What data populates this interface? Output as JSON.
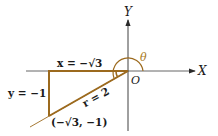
{
  "diagram": {
    "type": "trigonometry-reference-triangle",
    "axes": {
      "x_label": "X",
      "y_label": "Y",
      "origin_label": "O"
    },
    "angle_label": "θ",
    "labels": {
      "x_side": "x = −√3",
      "y_side": "y = −1",
      "hypotenuse": "r = 2",
      "point": "(−√3, −1)"
    },
    "point": {
      "x": "-√3",
      "y": "-1"
    },
    "r": 2,
    "colors": {
      "triangle": "#9c6a1e",
      "axes": "#3a3a3a",
      "label": "#1a1a1a",
      "angle": "#a97a1c"
    }
  }
}
